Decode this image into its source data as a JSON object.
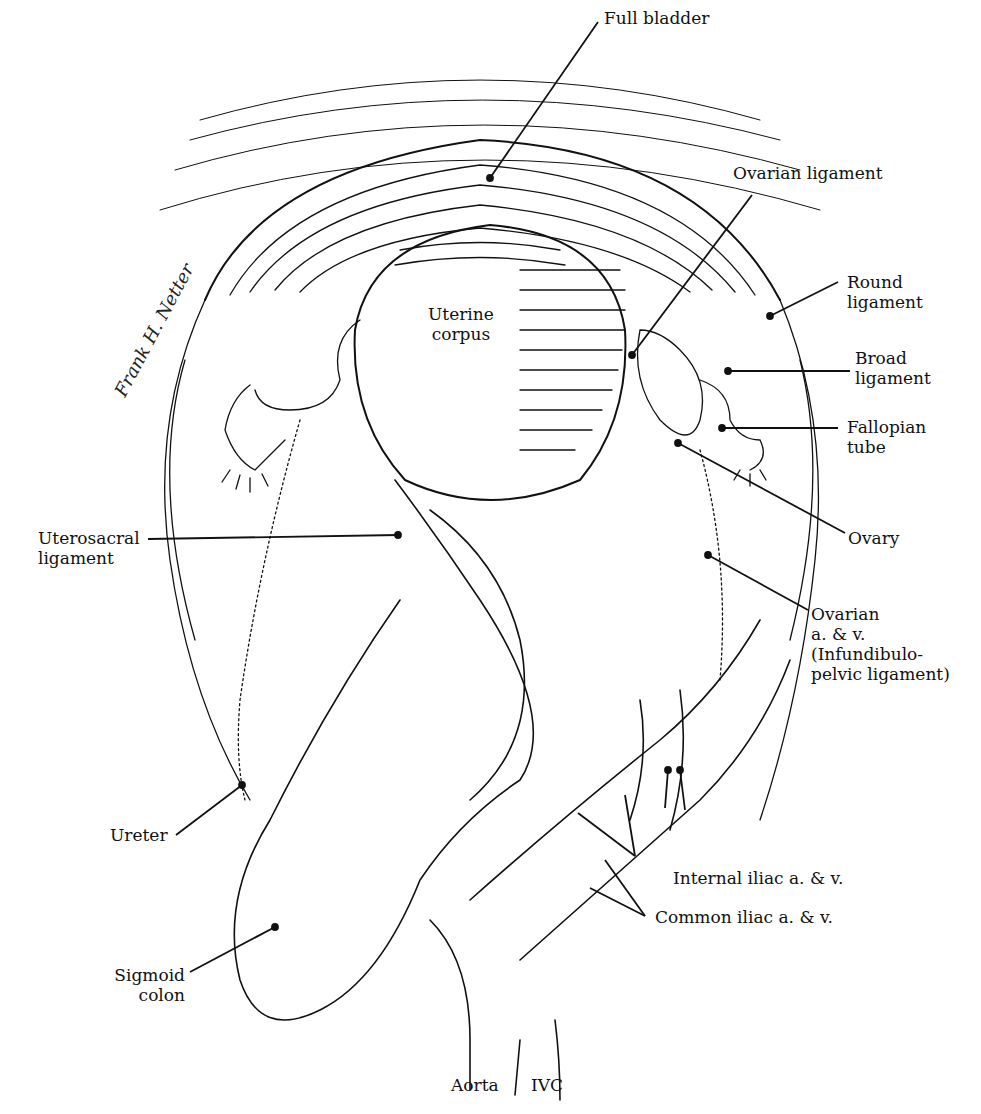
{
  "figure": {
    "type": "anatomical-illustration",
    "signature": "Frank H. Netter",
    "stroke_color": "#111111",
    "background_color": "#ffffff"
  },
  "labels": {
    "full_bladder": "Full bladder",
    "ovarian_ligament": "Ovarian ligament",
    "round_ligament": "Round\nligament",
    "broad_ligament": "Broad\nligament",
    "fallopian_tube": "Fallopian\ntube",
    "uterine_corpus": "Uterine\ncorpus",
    "ovary": "Ovary",
    "ovarian_vessels": "Ovarian\na. & v.\n(Infundibulo-\npelvic ligament)",
    "uterosacral_ligament": "Uterosacral\nligament",
    "ureter": "Ureter",
    "internal_iliac": "Internal iliac a. & v.",
    "common_iliac": "Common iliac a. & v.",
    "sigmoid_colon": "Sigmoid\ncolon",
    "aorta": "Aorta",
    "ivc": "IVC"
  }
}
